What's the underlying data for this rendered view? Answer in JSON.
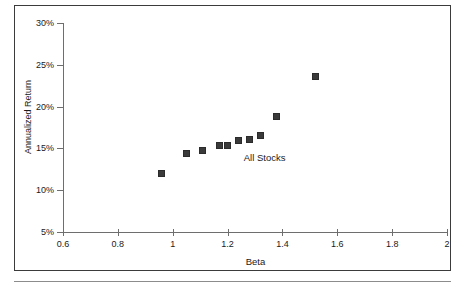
{
  "figure": {
    "frame_color": "#3b3b3b",
    "axis_color": "#6e6e6e",
    "marker_color": "#3a3a3a",
    "background": "#ffffff"
  },
  "chart_data": {
    "type": "scatter",
    "title": "",
    "xlabel": "Beta",
    "ylabel": "Annualized Return",
    "xlim": [
      0.6,
      2.0
    ],
    "ylim": [
      5,
      30
    ],
    "xticks": [
      0.6,
      0.8,
      1.0,
      1.2,
      1.4,
      1.6,
      1.8,
      2.0
    ],
    "xtick_labels": [
      "0.6",
      "0.8",
      "1",
      "1.2",
      "1.4",
      "1.6",
      "1.8",
      "2"
    ],
    "yticks": [
      5,
      10,
      15,
      20,
      25,
      30
    ],
    "ytick_labels": [
      "5%",
      "10%",
      "15%",
      "20%",
      "25%",
      "30%"
    ],
    "grid": false,
    "legend": "none",
    "annotations": [
      {
        "text": "All Stocks",
        "x": 1.335,
        "y": 14.0
      }
    ],
    "series": [
      {
        "name": "All Stocks",
        "marker": "square",
        "points": [
          {
            "x": 0.96,
            "y": 12.0
          },
          {
            "x": 1.05,
            "y": 14.4
          },
          {
            "x": 1.11,
            "y": 14.7
          },
          {
            "x": 1.17,
            "y": 15.4
          },
          {
            "x": 1.2,
            "y": 15.4
          },
          {
            "x": 1.24,
            "y": 15.9
          },
          {
            "x": 1.28,
            "y": 16.1
          },
          {
            "x": 1.32,
            "y": 16.6
          },
          {
            "x": 1.38,
            "y": 18.8
          },
          {
            "x": 1.52,
            "y": 23.6
          }
        ]
      }
    ]
  }
}
